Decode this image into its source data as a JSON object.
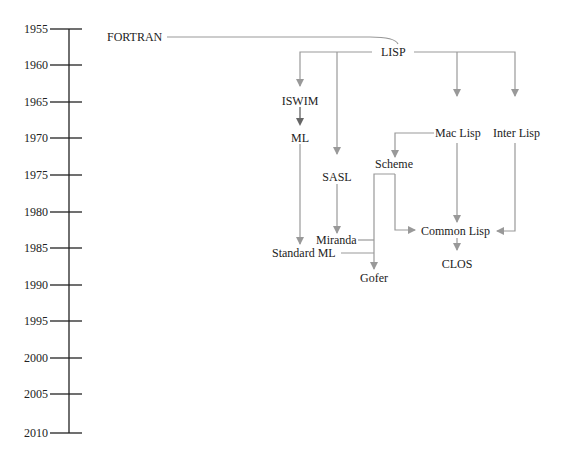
{
  "timeline": {
    "years": [
      "1955",
      "1960",
      "1965",
      "1970",
      "1975",
      "1980",
      "1985",
      "1990",
      "1995",
      "2000",
      "2005",
      "2010"
    ]
  },
  "nodes": {
    "fortran": "FORTRAN",
    "lisp": "LISP",
    "iswim": "ISWIM",
    "ml": "ML",
    "sasl": "SASL",
    "mac_lisp": "Mac Lisp",
    "inter_lisp": "Inter Lisp",
    "scheme": "Scheme",
    "miranda": "Miranda",
    "standard_ml": "Standard ML",
    "common_lisp": "Common Lisp",
    "clos": "CLOS",
    "gofer": "Gofer"
  },
  "colors": {
    "edge": "#999999",
    "edge_dark": "#555555",
    "text": "#222222",
    "axis": "#222222"
  }
}
